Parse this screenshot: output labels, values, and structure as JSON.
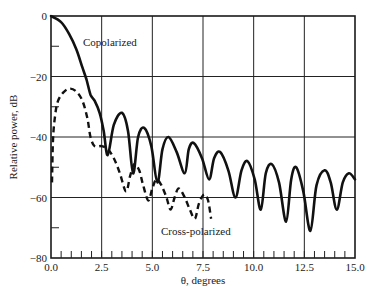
{
  "chart_data": {
    "type": "line",
    "title": "",
    "xlabel": "θ, degrees",
    "ylabel": "Relative power, dB",
    "xlim": [
      0,
      15
    ],
    "ylim": [
      -80,
      0
    ],
    "grid": true,
    "x_ticks": [
      0.0,
      2.5,
      5.0,
      7.5,
      10.0,
      12.5,
      15.0
    ],
    "x_tick_labels": [
      "0.0",
      "2.5",
      "5.0",
      "7.5",
      "10.0",
      "12.5",
      "15.0"
    ],
    "y_ticks": [
      0,
      -20,
      -40,
      -60,
      -80
    ],
    "y_tick_labels": [
      "0",
      "−20",
      "−40",
      "−60",
      "−80"
    ],
    "x_minor_step": 0.5,
    "y_minor_ticks": [
      -10,
      -30,
      -50,
      -70
    ],
    "annotations": [
      {
        "text": "Copolarized",
        "x": 1.6,
        "y": -8
      },
      {
        "text": "Cross-polarized",
        "x": 7.2,
        "y": -72
      }
    ],
    "series": [
      {
        "name": "Copolarized",
        "style": "solid",
        "x": [
          0.0,
          0.5,
          0.9,
          1.25,
          1.55,
          1.75,
          1.95,
          2.15,
          2.4,
          2.6,
          2.8,
          3.1,
          3.5,
          3.8,
          4.05,
          4.3,
          4.6,
          4.95,
          5.25,
          5.5,
          5.8,
          6.2,
          6.6,
          6.8,
          7.05,
          7.45,
          7.8,
          8.05,
          8.35,
          8.75,
          9.1,
          9.4,
          9.7,
          10.05,
          10.35,
          10.6,
          10.9,
          11.25,
          11.6,
          11.85,
          12.1,
          12.45,
          12.8,
          13.1,
          13.5,
          13.8,
          14.1,
          14.4,
          14.7,
          15.0
        ],
        "y": [
          0,
          -2,
          -6,
          -11,
          -17,
          -21,
          -26,
          -28,
          -32,
          -38,
          -46,
          -36,
          -32,
          -38,
          -52,
          -40,
          -37,
          -43,
          -55,
          -44,
          -40,
          -45,
          -52,
          -44,
          -42,
          -47,
          -54,
          -47,
          -45,
          -51,
          -60,
          -51,
          -48,
          -54,
          -64,
          -52,
          -49,
          -55,
          -68,
          -54,
          -50,
          -58,
          -71,
          -56,
          -51,
          -55,
          -64,
          -55,
          -52,
          -54
        ]
      },
      {
        "name": "Cross-polarized",
        "style": "dashed",
        "x": [
          0.05,
          0.1,
          0.2,
          0.35,
          0.65,
          0.95,
          1.25,
          1.55,
          1.8,
          1.95,
          2.15,
          2.5,
          2.8,
          3.1,
          3.4,
          3.7,
          3.9,
          4.1,
          4.35,
          4.55,
          4.8,
          5.0,
          5.2,
          5.45,
          5.7,
          5.9,
          6.1,
          6.3,
          6.6,
          6.85,
          7.1,
          7.3,
          7.55,
          7.75,
          7.9
        ],
        "y": [
          -55,
          -41,
          -33,
          -28,
          -25,
          -24,
          -25,
          -28,
          -34,
          -40,
          -43,
          -43,
          -44,
          -47,
          -52,
          -58,
          -53,
          -49,
          -51,
          -56,
          -61,
          -57,
          -54,
          -56,
          -60,
          -64,
          -60,
          -57,
          -60,
          -64,
          -67,
          -62,
          -59,
          -61,
          -67
        ]
      }
    ]
  },
  "labels": {
    "copolarized": "Copolarized",
    "cross_polarized": "Cross-polarized",
    "xlabel": "θ, degrees",
    "ylabel": "Relative power, dB"
  }
}
